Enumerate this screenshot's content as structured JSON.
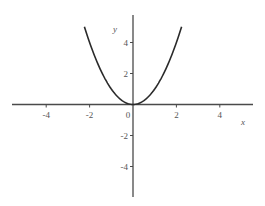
{
  "chart_data": {
    "type": "line",
    "title": "",
    "function": "y = x^2",
    "xlabel": "x",
    "ylabel": "y",
    "xlim": [
      -5.5,
      5.5
    ],
    "ylim": [
      -6,
      5.8
    ],
    "grid": false,
    "legend": null,
    "x_ticks": [
      -4,
      -2,
      0,
      2,
      4
    ],
    "y_ticks": [
      -4,
      -2,
      2,
      4
    ],
    "x_tick_labels": [
      "-4",
      "-2",
      "0",
      "2",
      "4"
    ],
    "y_tick_labels": [
      "-4",
      "-2",
      "2",
      "4"
    ],
    "series": [
      {
        "name": "y = x^2",
        "color": "#2a2a2a",
        "x": [
          -2.24,
          -2,
          -1.5,
          -1,
          -0.5,
          0,
          0.5,
          1,
          1.5,
          2,
          2.24
        ],
        "y": [
          5.02,
          4,
          2.25,
          1,
          0.25,
          0,
          0.25,
          1,
          2.25,
          4,
          5.02
        ]
      }
    ]
  },
  "layout": {
    "origin_px": [
      133,
      104.5
    ],
    "x_scale_px_per_unit": 21.7,
    "y_scale_px_per_unit": 15.5,
    "x_axis_px": [
      12,
      253
    ],
    "y_axis_px": [
      15,
      197
    ],
    "curve_domain": [
      -2.24,
      2.24
    ]
  }
}
